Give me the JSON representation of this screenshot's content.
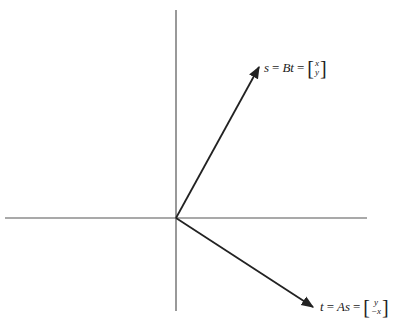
{
  "diagram": {
    "type": "vector-plane",
    "axes": {
      "vertical": {
        "x": 176,
        "y1": 10,
        "y2": 311
      },
      "horizontal": {
        "y": 218,
        "x1": 5,
        "x2": 367
      }
    },
    "origin": {
      "x": 176,
      "y": 218
    },
    "vectors": [
      {
        "name": "s",
        "from": [
          176,
          218
        ],
        "to": [
          259,
          67
        ],
        "label": {
          "lhs": "s",
          "eq1": "=",
          "mid": "Bt",
          "eq2": "=",
          "top": "x",
          "bottom": "y"
        }
      },
      {
        "name": "t",
        "from": [
          176,
          218
        ],
        "to": [
          313,
          307
        ],
        "label": {
          "lhs": "t",
          "eq1": "=",
          "mid": "As",
          "eq2": "=",
          "top": "y",
          "bottom": "−x"
        }
      }
    ],
    "colors": {
      "axis": "#555555",
      "vector": "#222222"
    }
  }
}
